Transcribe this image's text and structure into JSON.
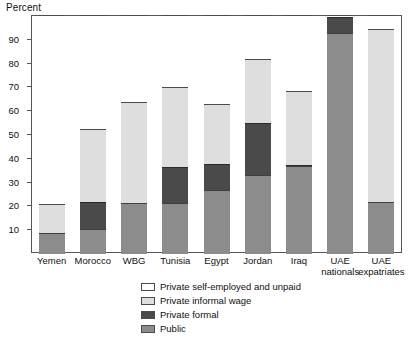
{
  "chart_data": {
    "type": "bar",
    "title": "",
    "subtitle": "",
    "xlabel": "",
    "ylabel": "Percent",
    "ylim": [
      0,
      100
    ],
    "ytick_values": [
      10,
      20,
      30,
      40,
      50,
      60,
      70,
      80,
      90
    ],
    "ytick_labels": [
      "10",
      "20",
      "30",
      "40",
      "50",
      "60",
      "70",
      "80",
      "90"
    ],
    "grid": false,
    "stacked": true,
    "legend_position": "bottom",
    "categories": [
      "Yemen",
      "Morocco",
      "WBG",
      "Tunisia",
      "Egypt",
      "Jordan",
      "Iraq",
      "UAE nationals",
      "UAE expatriates"
    ],
    "category_lines": [
      [
        "Yemen",
        ""
      ],
      [
        "Morocco",
        ""
      ],
      [
        "WBG",
        ""
      ],
      [
        "Tunisia",
        ""
      ],
      [
        "Egypt",
        ""
      ],
      [
        "Jordan",
        ""
      ],
      [
        "Iraq",
        ""
      ],
      [
        "UAE",
        "nationals"
      ],
      [
        "UAE",
        "expatriates"
      ]
    ],
    "series": [
      {
        "name": "Public",
        "color": "#8c8c8c",
        "values": [
          9,
          10.5,
          21.5,
          21.5,
          27,
          33,
          37,
          93,
          22
        ]
      },
      {
        "name": "Private formal",
        "color": "#4a4a4a",
        "values": [
          0,
          11.5,
          0,
          15,
          11,
          22,
          0.5,
          6.5,
          0
        ]
      },
      {
        "name": "Private informal wage",
        "color": "#dedede",
        "values": [
          12,
          30.5,
          42.5,
          33.5,
          25,
          27,
          31.5,
          0,
          72.5
        ]
      },
      {
        "name": "Private self-employed and unpaid",
        "color": "#ffffff",
        "values": [
          79,
          47.5,
          36,
          30,
          37,
          18,
          31.5,
          0.5,
          5.5
        ]
      }
    ],
    "cumulative_tops": {
      "public": [
        9,
        10.5,
        21.5,
        21.5,
        27,
        33,
        37,
        93,
        22
      ],
      "formal": [
        9,
        22,
        21.5,
        36.5,
        38,
        55,
        37.5,
        99.5,
        22
      ],
      "informal": [
        21,
        52.5,
        64,
        70,
        63,
        82,
        68.5,
        99.5,
        94.5
      ],
      "selfemp": [
        100,
        100,
        100,
        100,
        100,
        100,
        100,
        100,
        100
      ]
    }
  },
  "legend": {
    "items": [
      {
        "label": "Private self-employed and unpaid",
        "swatch": "sw-selfemp"
      },
      {
        "label": "Private informal wage",
        "swatch": "sw-informal"
      },
      {
        "label": "Private formal",
        "swatch": "sw-formal"
      },
      {
        "label": "Public",
        "swatch": "sw-public"
      }
    ]
  }
}
